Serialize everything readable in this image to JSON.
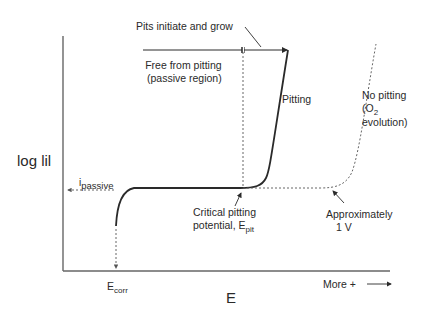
{
  "diagram": {
    "y_axis_label": "log lil",
    "x_axis_label": "E",
    "x_axis_direction": {
      "text": "More +",
      "arrow": "right-arrow"
    },
    "labels": {
      "pits_initiate": "Pits initiate and grow",
      "free_from_pitting_line1": "Free from pitting",
      "free_from_pitting_line2": "(passive region)",
      "pitting": "Pitting",
      "no_pitting_line1": "No pitting",
      "no_pitting_line2_prefix": "(O",
      "no_pitting_line2_sub": "2",
      "no_pitting_line3": "evolution)",
      "i_passive_main": "i",
      "i_passive_sub": "passive",
      "critical_line1": "Critical pitting",
      "critical_line2_prefix": "potential, E",
      "critical_line2_sub": "pit",
      "approx_line1": "Approximately",
      "approx_line2": "1 V",
      "ecorr_main": "E",
      "ecorr_sub": "corr"
    },
    "colors": {
      "line": "#2a2a2a",
      "dashed": "#555555",
      "background": "#ffffff"
    }
  }
}
